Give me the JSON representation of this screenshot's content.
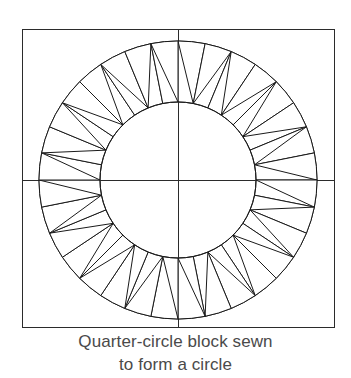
{
  "figure": {
    "caption_line_1": "Quarter-circle block sewn",
    "caption_line_2": "to form a circle",
    "caption_full": "Quarter-circle block sewn to form a circle"
  },
  "colors": {
    "background": "#ffffff",
    "line": "#1a1a1a",
    "axis_line": "#2b2b2b",
    "frame": "#2b2b2b",
    "caption_text": "#4a4a4a",
    "fill": "#ffffff"
  },
  "chart_data": {
    "type": "diagram",
    "title": "Quarter-circle block sewn to form a circle",
    "center": {
      "x": 178,
      "y": 180
    },
    "square": {
      "x": 22,
      "y": 29,
      "width": 312,
      "height": 298
    },
    "outer_radius": 139,
    "inner_radius": 78,
    "wedge_count": 32,
    "wedges_per_quadrant": 8,
    "triangles_per_wedge": 2,
    "total_triangles": 64,
    "quadrants": 4,
    "axes": [
      "horizontal",
      "vertical"
    ],
    "stroke_width": 1,
    "grid": false,
    "legend": "none"
  }
}
